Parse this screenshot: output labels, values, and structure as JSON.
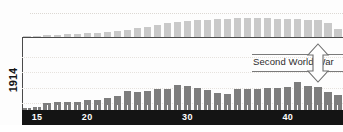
{
  "figure": {
    "year_axis_label": "1914",
    "annotation": {
      "text": "Second World War",
      "arrow_icon": "double-headed-vertical-arrow-icon"
    }
  },
  "chart_data": {
    "type": "bar",
    "title": "",
    "subtitle": "",
    "xlabel": "",
    "ylabel": "",
    "grid": true,
    "legend_position": "none",
    "x_tick_labels": [
      "15",
      "20",
      "30",
      "40"
    ],
    "x_tick_values": [
      1915,
      1920,
      1930,
      1940
    ],
    "x_range": [
      1913.5,
      1945.5
    ],
    "categories": [
      1914,
      1915,
      1916,
      1917,
      1918,
      1919,
      1920,
      1921,
      1922,
      1923,
      1924,
      1925,
      1926,
      1927,
      1928,
      1929,
      1930,
      1931,
      1932,
      1933,
      1934,
      1935,
      1936,
      1937,
      1938,
      1939,
      1940,
      1941,
      1942,
      1943,
      1944,
      1945
    ],
    "series": [
      {
        "name": "upper-series",
        "orientation": "inverted-top",
        "color": "#c9c9c9",
        "values": [
          2,
          2,
          3,
          3,
          4,
          4,
          5,
          5,
          6,
          7,
          8,
          10,
          11,
          13,
          15,
          16,
          17,
          18,
          18,
          19,
          19,
          20,
          20,
          20,
          20,
          19,
          19,
          19,
          18,
          18,
          15,
          9
        ],
        "ylim": [
          0,
          24
        ]
      },
      {
        "name": "lower-series",
        "orientation": "upright-bottom",
        "color": "#7d7d7d",
        "values": [
          2,
          3,
          7,
          8,
          8,
          8,
          10,
          10,
          12,
          14,
          19,
          18,
          19,
          21,
          21,
          25,
          24,
          22,
          20,
          17,
          16,
          21,
          21,
          21,
          22,
          22,
          23,
          28,
          24,
          23,
          18,
          15
        ],
        "ylim": [
          0,
          73
        ]
      }
    ],
    "annotations": [
      {
        "label": "Second World War",
        "x_start": 1939,
        "x_end": 1945,
        "style": "vertical-double-arrow-with-rules"
      }
    ]
  }
}
